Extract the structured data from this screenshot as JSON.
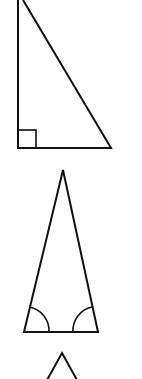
{
  "figure": {
    "type": "triangle-types",
    "stroke_color": "#111111",
    "background": "#ffffff",
    "shapes": [
      {
        "name": "right-triangle",
        "vertices": [
          [
            18,
            0
          ],
          [
            18,
            148
          ],
          [
            111,
            148
          ],
          [
            23,
            0
          ]
        ],
        "marker": "right-angle-square",
        "marker_rect": [
          18,
          130,
          18,
          18
        ]
      },
      {
        "name": "isosceles-triangle",
        "vertices": [
          [
            63,
            170
          ],
          [
            24,
            332
          ],
          [
            98,
            332
          ]
        ],
        "marker": "equal-base-angle-arcs"
      },
      {
        "name": "partial-triangle",
        "vertices": [
          [
            62,
            353
          ],
          [
            47,
            379
          ],
          [
            77,
            379
          ]
        ],
        "marker": "none"
      }
    ]
  }
}
